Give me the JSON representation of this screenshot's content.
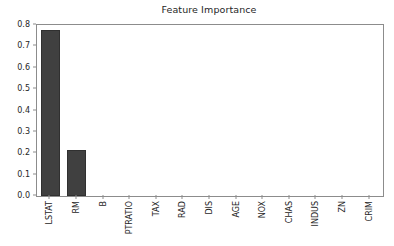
{
  "chart_data": {
    "type": "bar",
    "title": "Feature Importance",
    "xlabel": "",
    "ylabel": "",
    "categories": [
      "LSTAT",
      "RM",
      "B",
      "PTRATIO",
      "TAX",
      "RAD",
      "DIS",
      "AGE",
      "NOX",
      "CHAS",
      "INDUS",
      "ZN",
      "CRIM"
    ],
    "values": [
      0.777,
      0.215,
      0.003,
      0.002,
      0.001,
      0.001,
      0.001,
      0.0,
      0.0,
      0.0,
      0.0,
      0.0,
      0.0
    ],
    "ylim": [
      0.0,
      0.8
    ],
    "yticks": [
      0.0,
      0.1,
      0.2,
      0.3,
      0.4,
      0.5,
      0.6,
      0.7,
      0.8
    ],
    "ytick_labels": [
      "0.0",
      "0.1",
      "0.2",
      "0.3",
      "0.4",
      "0.5",
      "0.6",
      "0.7",
      "0.8"
    ],
    "grid": false,
    "legend": null,
    "bar_color": "#404040",
    "bar_edge_color": "#303030",
    "axis_color": "#8c8c8c",
    "text_color": "#262626",
    "background_color": "#ffffff",
    "xtick_rotation": -90
  }
}
